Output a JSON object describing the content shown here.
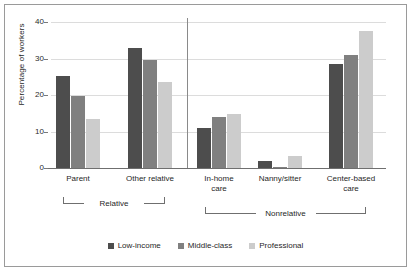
{
  "chart_data": {
    "type": "bar",
    "title": "",
    "xlabel": "",
    "ylabel": "Percentage of workers",
    "ylim": [
      0,
      40
    ],
    "yticks": [
      0,
      10,
      20,
      30,
      40
    ],
    "ytick_labels": [
      "0",
      "10",
      "20",
      "30",
      "40"
    ],
    "grid": true,
    "legend_position": "bottom",
    "categories": [
      "Parent",
      "Other relative",
      "In-home care",
      "Nanny/sitter",
      "Center-based care"
    ],
    "category_lines": [
      [
        "Parent"
      ],
      [
        "Other relative"
      ],
      [
        "In-home",
        "care"
      ],
      [
        "Nanny/sitter"
      ],
      [
        "Center-based",
        "care"
      ]
    ],
    "series": [
      {
        "name": "Low-income",
        "color": "#4d4d4d",
        "values": [
          25.2,
          32.9,
          10.9,
          1.9,
          28.4
        ]
      },
      {
        "name": "Middle-class",
        "color": "#808080",
        "values": [
          19.7,
          29.5,
          14.1,
          0.4,
          31.0
        ]
      },
      {
        "name": "Professional",
        "color": "#cccccc",
        "values": [
          13.5,
          23.6,
          14.8,
          3.4,
          37.6
        ]
      }
    ],
    "group_brackets": [
      {
        "label": "Relative",
        "categories": [
          "Parent",
          "Other relative"
        ]
      },
      {
        "label": "Nonrelative",
        "categories": [
          "In-home care",
          "Nanny/sitter",
          "Center-based care"
        ]
      }
    ]
  },
  "legend": {
    "items": [
      {
        "label": "Low-income",
        "color": "#4d4d4d"
      },
      {
        "label": "Middle-class",
        "color": "#808080"
      },
      {
        "label": "Professional",
        "color": "#cccccc"
      }
    ]
  }
}
